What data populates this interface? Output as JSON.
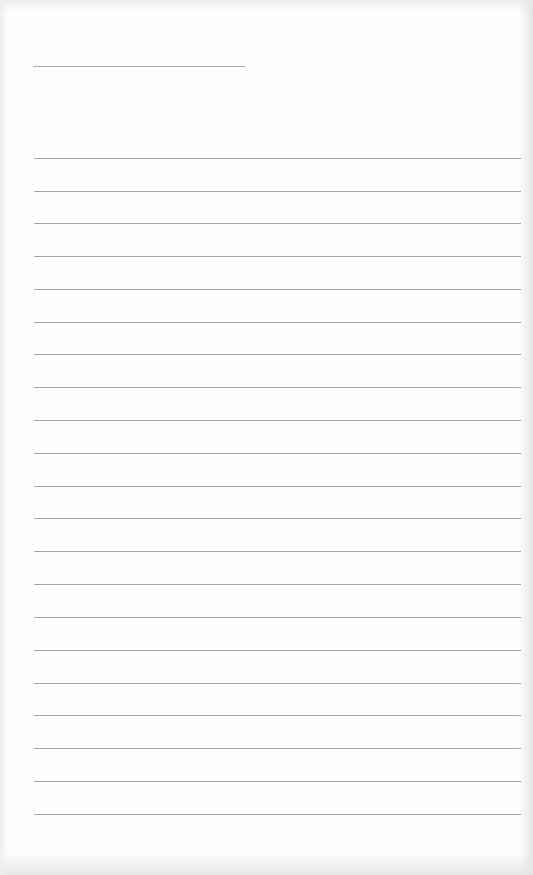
{
  "page": {
    "type": "lined-paper",
    "background_color": "#fefefe",
    "line_color": "#a6a6a6",
    "header_line": {
      "x": 33,
      "y": 66,
      "width": 212
    },
    "rules": {
      "x": 34,
      "width": 487,
      "y_positions": [
        158,
        191,
        223,
        256,
        289,
        322,
        354,
        387,
        420,
        453,
        486,
        518,
        551,
        584,
        617,
        650,
        683,
        715,
        748,
        781,
        814
      ]
    }
  }
}
